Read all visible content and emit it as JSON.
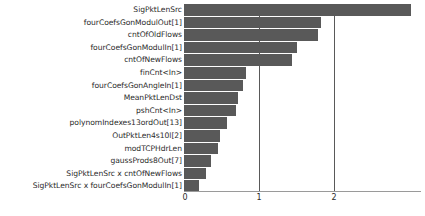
{
  "chart_data": {
    "type": "bar",
    "orientation": "horizontal",
    "title": "",
    "xlabel": "",
    "ylabel": "",
    "xlim": [
      0,
      3.2
    ],
    "grid": true,
    "legend": null,
    "bar_color": "#595959",
    "axis_color": "#9a9a9a",
    "tick_labels": [
      "0",
      "1",
      "2"
    ],
    "tick_values": [
      0,
      1,
      2
    ],
    "categories": [
      "SigPktLenSrc",
      "fourCoefsGonModulOut[1]",
      "cntOfOldFlows",
      "fourCoefsGonModulIn[1]",
      "cntOfNewFlows",
      "finCnt<In>",
      "fourCoefsGonAngleIn[1]",
      "MeanPktLenDst",
      "pshCnt<In>",
      "polynomIndexes13ordOut[13]",
      "OutPktLen4s10l[2]",
      "modTCPHdrLen",
      "gaussProds8Out[7]",
      "SigPktLenSrc x cntOfNewFlows",
      "SigPktLenSrc x fourCoefsGonModulIn[1]"
    ],
    "values": [
      3.02,
      1.83,
      1.79,
      1.51,
      1.44,
      0.83,
      0.79,
      0.72,
      0.69,
      0.57,
      0.48,
      0.45,
      0.36,
      0.29,
      0.2
    ]
  }
}
